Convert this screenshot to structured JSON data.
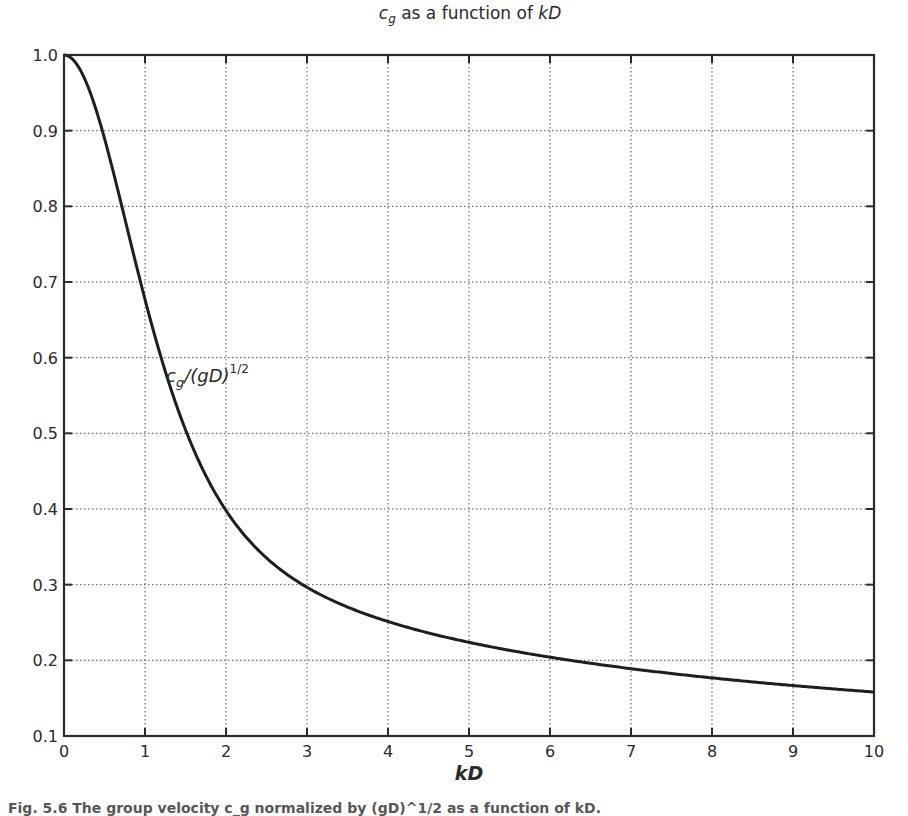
{
  "chart_data": {
    "type": "line",
    "title_parts": {
      "var": "c",
      "sub": "g",
      "rest": " as a function of ",
      "italic_end": "kD"
    },
    "xlabel": "kD",
    "ylabel": "",
    "xlim": [
      0,
      10
    ],
    "ylim": [
      0.1,
      1.0
    ],
    "grid": true,
    "grid_style": "dotted",
    "legend": null,
    "x_ticks": [
      0,
      1,
      2,
      3,
      4,
      5,
      6,
      7,
      8,
      9,
      10
    ],
    "x_tick_labels": [
      "0",
      "1",
      "2",
      "3",
      "4",
      "5",
      "6",
      "7",
      "8",
      "9",
      "10"
    ],
    "y_ticks": [
      0.1,
      0.2,
      0.3,
      0.4,
      0.5,
      0.6,
      0.7,
      0.8,
      0.9,
      1.0
    ],
    "y_tick_labels": [
      "0.1",
      "0.2",
      "0.3",
      "0.4",
      "0.5",
      "0.6",
      "0.7",
      "0.8",
      "0.9",
      "1.0"
    ],
    "series": [
      {
        "name": "c_g/(gD)^1/2",
        "formula": "0.5*sqrt(tanh(kD)/kD)*(1+2kD/sinh(2kD))",
        "x": [
          0,
          0.5,
          1,
          1.5,
          2,
          2.5,
          3,
          4,
          5,
          6,
          7,
          8,
          9,
          10
        ],
        "values": [
          1.0,
          0.887,
          0.692,
          0.53,
          0.409,
          0.335,
          0.29,
          0.25,
          0.224,
          0.204,
          0.189,
          0.177,
          0.167,
          0.158
        ]
      }
    ],
    "annotations": [
      {
        "text_parts": {
          "var": "c",
          "sub": "g",
          "mid": "/(gD)",
          "sup": "1/2"
        },
        "x": 1.45,
        "y": 0.565
      }
    ]
  },
  "caption": "Fig. 5.6 The group velocity c_g normalized by (gD)^1/2 as a function of kD."
}
